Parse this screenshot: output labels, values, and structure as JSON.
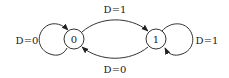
{
  "diagram": {
    "type": "state-machine",
    "nodes": [
      {
        "id": "0",
        "label": "0"
      },
      {
        "id": "1",
        "label": "1"
      }
    ],
    "edges": [
      {
        "from": "0",
        "to": "0",
        "label": "D=0"
      },
      {
        "from": "0",
        "to": "1",
        "label": "D=1"
      },
      {
        "from": "1",
        "to": "1",
        "label": "D=1"
      },
      {
        "from": "1",
        "to": "0",
        "label": "D=0"
      }
    ]
  },
  "colors": {
    "stroke": "#333333",
    "background": "#ffffff"
  }
}
